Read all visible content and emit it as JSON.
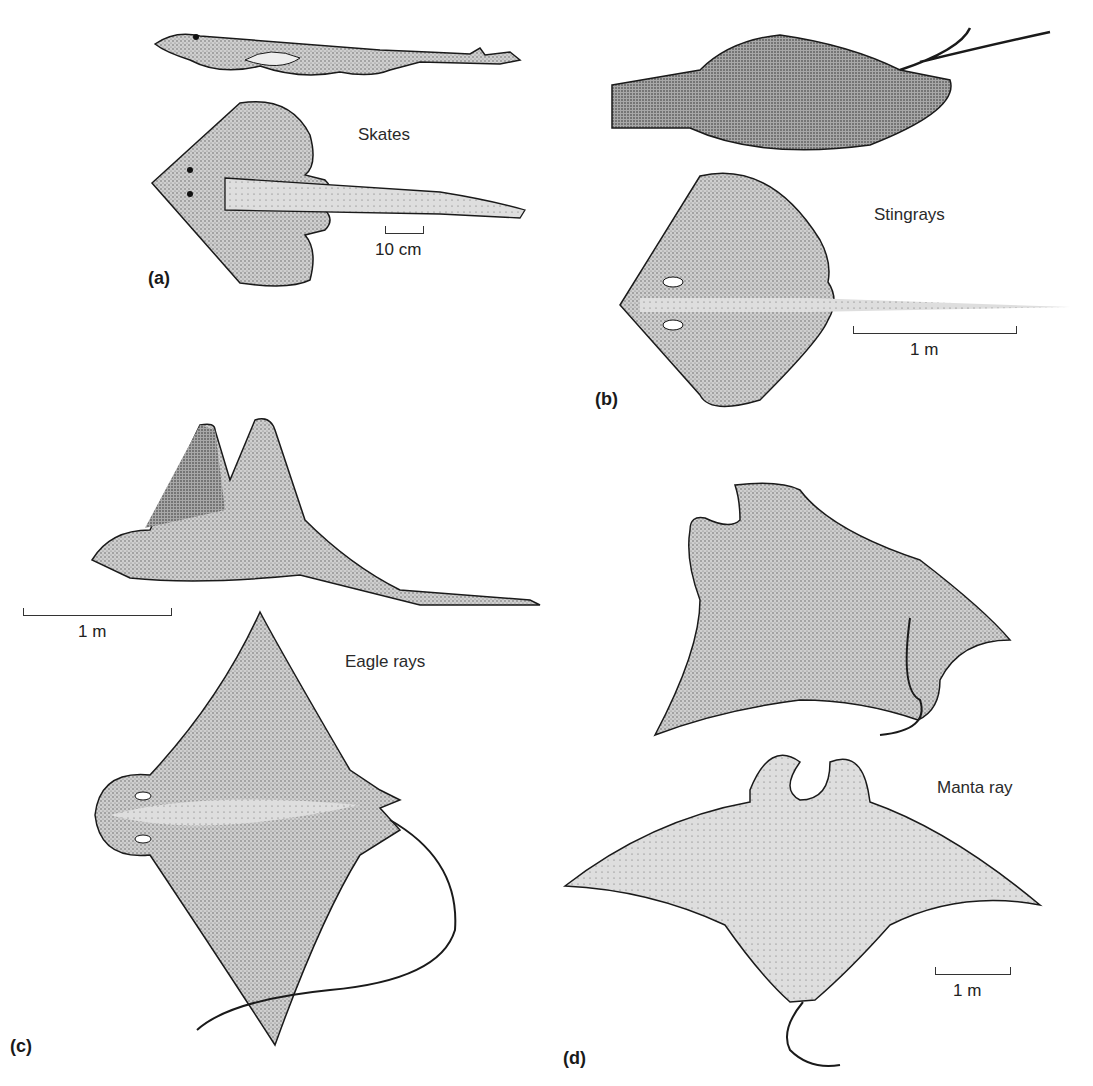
{
  "figure": {
    "panels": [
      {
        "id": "a",
        "label": "(a)",
        "group": "Skates",
        "scale_bar": "10 cm"
      },
      {
        "id": "b",
        "label": "(b)",
        "group": "Stingrays",
        "scale_bar": "1 m"
      },
      {
        "id": "c",
        "label": "(c)",
        "group": "Eagle rays",
        "scale_bar": "1 m"
      },
      {
        "id": "d",
        "label": "(d)",
        "group": "Manta ray",
        "scale_bar": "1 m"
      }
    ],
    "colors": {
      "fill_light": "#d9d9d9",
      "fill_mid": "#b5b5b5",
      "fill_dark": "#8a8a8a",
      "outline": "#1a1a1a"
    }
  }
}
